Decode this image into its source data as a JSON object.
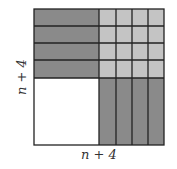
{
  "diagram": {
    "labels": {
      "left": "n + 4",
      "bottom": "n + 4"
    },
    "regions": {
      "n_squared": {
        "name": "n × n square",
        "fill": "#ffffff"
      },
      "horizontal_strips": {
        "name": "four n × 1 strips",
        "count": 4,
        "fill": "#8a8a8a"
      },
      "vertical_strips": {
        "name": "four 1 × n strips",
        "count": 4,
        "fill": "#8a8a8a"
      },
      "unit_squares": {
        "name": "sixteen 1 × 1 squares",
        "count": 16,
        "fill": "#c4c4c4"
      }
    },
    "colors": {
      "line": "#222222",
      "dark_fill": "#8a8a8a",
      "light_fill": "#c4c4c4",
      "white_fill": "#ffffff"
    }
  }
}
